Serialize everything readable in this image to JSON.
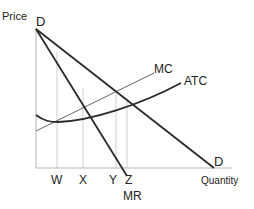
{
  "diagram": {
    "axes": {
      "y_label": "Price",
      "x_label": "Quantity"
    },
    "curves": {
      "demand_top_label": "D",
      "demand_bottom_label": "D",
      "mc_label": "MC",
      "atc_label": "ATC",
      "mr_label": "MR"
    },
    "quantity_marks": [
      "W",
      "X",
      "Y",
      "Z"
    ],
    "colors": {
      "curve": "#2a2a2a",
      "thin_line": "#555555",
      "guide": "#c8c8c8",
      "axis": "#b0b0b0"
    }
  }
}
